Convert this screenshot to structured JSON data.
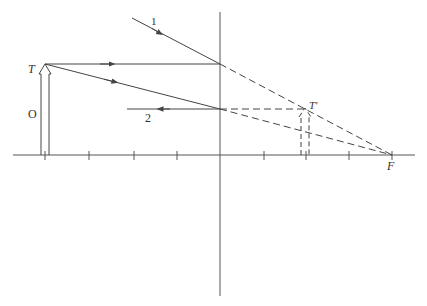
{
  "diagram": {
    "type": "ray-diagram-diverging-lens",
    "colors": {
      "line": "#555555",
      "ray": "#444444",
      "background": "#ffffff"
    },
    "axis": {
      "x1": 13,
      "x2": 415,
      "y": 155
    },
    "lens": {
      "x": 220,
      "y1": 12,
      "y2": 296
    },
    "ticks": [
      45,
      89,
      134,
      177,
      264,
      306,
      349,
      392
    ],
    "labels": {
      "object_tip": "T",
      "object": "O",
      "image_tip": "T'",
      "focal_point": "F",
      "ray1": "1",
      "ray2": "2"
    },
    "object": {
      "x": 45,
      "tip_y": 64,
      "base_y": 155
    },
    "image": {
      "x": 305,
      "tip_y": 108,
      "base_y": 155
    },
    "focal_point": {
      "x": 392,
      "y": 155
    },
    "rays": [
      {
        "id": "1",
        "from": [
          132,
          18
        ],
        "to": [
          220,
          64
        ],
        "style": "solid",
        "arrow": "toward-lens"
      },
      {
        "id": "T-horizontal",
        "from": [
          45,
          64
        ],
        "to": [
          220,
          64
        ],
        "style": "solid",
        "arrow": "right"
      },
      {
        "id": "T-to-lens",
        "from": [
          45,
          64
        ],
        "to": [
          220,
          109
        ],
        "style": "solid",
        "arrow": "right"
      },
      {
        "id": "2",
        "from": [
          220,
          109
        ],
        "to": [
          127,
          109
        ],
        "style": "solid",
        "arrow": "left"
      },
      {
        "id": "ext-upper",
        "from": [
          220,
          64
        ],
        "to": [
          392,
          155
        ],
        "style": "dashed"
      },
      {
        "id": "ext-lower",
        "from": [
          220,
          109
        ],
        "to": [
          392,
          155
        ],
        "style": "dashed"
      },
      {
        "id": "ext-horizontal",
        "from": [
          220,
          109
        ],
        "to": [
          305,
          109
        ],
        "style": "dashed"
      }
    ]
  }
}
